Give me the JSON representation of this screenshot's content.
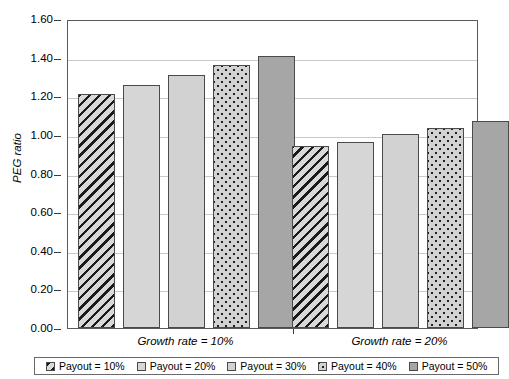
{
  "chart_data": {
    "type": "bar",
    "title": "",
    "subtitle": "",
    "xlabel": "",
    "ylabel": "PEG ratio",
    "categories": [
      "Growth rate = 10%",
      "Growth rate = 20%"
    ],
    "series": [
      {
        "name": "Payout = 10%",
        "values": [
          1.21,
          0.94
        ],
        "fill": "diagonal-hatch",
        "color": "#d9d9d9"
      },
      {
        "name": "Payout = 20%",
        "values": [
          1.26,
          0.965
        ],
        "fill": "solid-light",
        "color": "#d6d6d6"
      },
      {
        "name": "Payout = 30%",
        "values": [
          1.31,
          1.005
        ],
        "fill": "solid-light",
        "color": "#d2d2d2"
      },
      {
        "name": "Payout = 40%",
        "values": [
          1.36,
          1.035
        ],
        "fill": "dotted",
        "color": "#d2d2d2"
      },
      {
        "name": "Payout = 50%",
        "values": [
          1.41,
          1.07
        ],
        "fill": "solid-dark",
        "color": "#a6a6a6"
      }
    ],
    "ylim": [
      0.0,
      1.6
    ],
    "ytick_step": 0.2,
    "ytick_labels": [
      "0.00",
      "0.20",
      "0.40",
      "0.60",
      "0.80",
      "1.00",
      "1.20",
      "1.40",
      "1.60"
    ],
    "ytick_values": [
      0.0,
      0.2,
      0.4,
      0.6,
      0.8,
      1.0,
      1.2,
      1.4,
      1.6
    ],
    "grid": true,
    "grid_axis": "y",
    "legend_position": "bottom",
    "legend_entries": [
      "Payout = 10%",
      "Payout = 20%",
      "Payout = 30%",
      "Payout = 40%",
      "Payout = 50%"
    ]
  }
}
